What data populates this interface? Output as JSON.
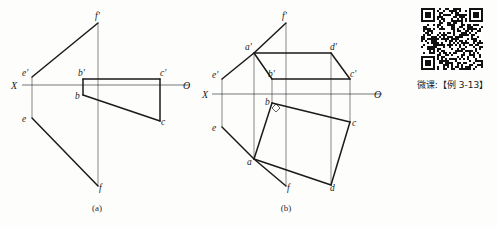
{
  "page": {
    "background_color": "#fdfdfc",
    "width": 497,
    "height": 227
  },
  "figures": [
    {
      "id": "figure-a",
      "caption": "(a)",
      "caption_pos": {
        "x": 97,
        "y": 211
      },
      "axis": {
        "name": "projection-axis",
        "x_label": "X",
        "o_label": "O",
        "x1": 22,
        "y1": 85,
        "x2": 190,
        "y2": 85,
        "color": "#77787a",
        "x_label_pos": {
          "x": 11,
          "y": 89
        },
        "o_label_pos": {
          "x": 183,
          "y": 89
        }
      },
      "points": [
        {
          "name": "f-prime",
          "label": "f'",
          "x": 98,
          "y": 23,
          "lx": 95,
          "ly": 19
        },
        {
          "name": "e-prime",
          "label": "e'",
          "x": 32,
          "y": 77,
          "lx": 22,
          "ly": 76
        },
        {
          "name": "b-prime",
          "label": "b'",
          "x": 83,
          "y": 79,
          "lx": 78,
          "ly": 76
        },
        {
          "name": "c-prime",
          "label": "c'",
          "x": 160,
          "y": 79,
          "lx": 160,
          "ly": 76
        },
        {
          "name": "b",
          "label": "b",
          "x": 83,
          "y": 95,
          "lx": 75,
          "ly": 99
        },
        {
          "name": "c",
          "label": "c",
          "x": 160,
          "y": 121,
          "lx": 161,
          "ly": 125
        },
        {
          "name": "e",
          "label": "e",
          "x": 32,
          "y": 118,
          "lx": 22,
          "ly": 122
        },
        {
          "name": "f",
          "label": "f",
          "x": 98,
          "y": 186,
          "lx": 99,
          "ly": 191
        }
      ],
      "thin_lines": [
        {
          "name": "vline-e",
          "x1": 32,
          "y1": 77,
          "x2": 32,
          "y2": 118
        },
        {
          "name": "vline-f",
          "x1": 98,
          "y1": 23,
          "x2": 98,
          "y2": 186
        }
      ],
      "thick_lines": [
        {
          "name": "seg-ef-prime",
          "x1": 32,
          "y1": 77,
          "x2": 98,
          "y2": 23
        },
        {
          "name": "seg-ef",
          "x1": 32,
          "y1": 118,
          "x2": 98,
          "y2": 186
        },
        {
          "name": "seg-bc-prime",
          "x1": 83,
          "y1": 79,
          "x2": 160,
          "y2": 79
        },
        {
          "name": "seg-bprime-b",
          "x1": 83,
          "y1": 79,
          "x2": 83,
          "y2": 95
        },
        {
          "name": "seg-cprime-c",
          "x1": 160,
          "y1": 79,
          "x2": 160,
          "y2": 121
        },
        {
          "name": "seg-bc",
          "x1": 83,
          "y1": 95,
          "x2": 160,
          "y2": 121
        }
      ]
    },
    {
      "id": "figure-b",
      "caption": "(b)",
      "caption_pos": {
        "x": 286,
        "y": 211
      },
      "axis": {
        "name": "projection-axis",
        "x_label": "X",
        "o_label": "O",
        "x1": 212,
        "y1": 94,
        "x2": 382,
        "y2": 94,
        "color": "#77787a",
        "x_label_pos": {
          "x": 202,
          "y": 98
        },
        "o_label_pos": {
          "x": 374,
          "y": 98
        }
      },
      "points": [
        {
          "name": "f-prime",
          "label": "f'",
          "x": 286,
          "y": 23,
          "lx": 282,
          "ly": 19
        },
        {
          "name": "a-prime",
          "label": "a'",
          "x": 254,
          "y": 53,
          "lx": 245,
          "ly": 50
        },
        {
          "name": "d-prime",
          "label": "d'",
          "x": 331,
          "y": 53,
          "lx": 330,
          "ly": 50
        },
        {
          "name": "e-prime",
          "label": "e'",
          "x": 222,
          "y": 79,
          "lx": 212,
          "ly": 78
        },
        {
          "name": "b-prime",
          "label": "b'",
          "x": 272,
          "y": 79,
          "lx": 268,
          "ly": 77
        },
        {
          "name": "c-prime",
          "label": "c'",
          "x": 350,
          "y": 79,
          "lx": 350,
          "ly": 77
        },
        {
          "name": "b",
          "label": "b",
          "x": 272,
          "y": 103,
          "lx": 265,
          "ly": 105
        },
        {
          "name": "c",
          "label": "c",
          "x": 350,
          "y": 122,
          "lx": 352,
          "ly": 126
        },
        {
          "name": "e",
          "label": "e",
          "x": 222,
          "y": 127,
          "lx": 212,
          "ly": 131
        },
        {
          "name": "a",
          "label": "a",
          "x": 254,
          "y": 159,
          "lx": 247,
          "ly": 165
        },
        {
          "name": "f",
          "label": "f",
          "x": 286,
          "y": 186,
          "lx": 287,
          "ly": 191
        },
        {
          "name": "d",
          "label": "d",
          "x": 331,
          "y": 185,
          "lx": 330,
          "ly": 191
        }
      ],
      "thin_lines": [
        {
          "name": "vline-e",
          "x1": 222,
          "y1": 79,
          "x2": 222,
          "y2": 127
        },
        {
          "name": "vline-a",
          "x1": 254,
          "y1": 53,
          "x2": 254,
          "y2": 159
        },
        {
          "name": "vline-f",
          "x1": 286,
          "y1": 23,
          "x2": 286,
          "y2": 186
        },
        {
          "name": "vline-d",
          "x1": 331,
          "y1": 53,
          "x2": 331,
          "y2": 185
        },
        {
          "name": "vline-c",
          "x1": 350,
          "y1": 79,
          "x2": 350,
          "y2": 122
        },
        {
          "name": "vline-b",
          "x1": 272,
          "y1": 79,
          "x2": 272,
          "y2": 103
        }
      ],
      "thick_lines": [
        {
          "name": "seg-aprime-fprime",
          "x1": 254,
          "y1": 53,
          "x2": 286,
          "y2": 23
        },
        {
          "name": "seg-eprime-aprime",
          "x1": 222,
          "y1": 79,
          "x2": 254,
          "y2": 53
        },
        {
          "name": "seg-aprime-dprime",
          "x1": 254,
          "y1": 53,
          "x2": 331,
          "y2": 53
        },
        {
          "name": "seg-dprime-cprime",
          "x1": 331,
          "y1": 53,
          "x2": 350,
          "y2": 79
        },
        {
          "name": "seg-aprime-bprime",
          "x1": 254,
          "y1": 53,
          "x2": 272,
          "y2": 79
        },
        {
          "name": "seg-bprime-cprime",
          "x1": 272,
          "y1": 79,
          "x2": 350,
          "y2": 79
        },
        {
          "name": "seg-e-a",
          "x1": 222,
          "y1": 127,
          "x2": 254,
          "y2": 159
        },
        {
          "name": "seg-a-f",
          "x1": 254,
          "y1": 159,
          "x2": 286,
          "y2": 186
        },
        {
          "name": "seg-b-a",
          "x1": 272,
          "y1": 103,
          "x2": 254,
          "y2": 159
        },
        {
          "name": "seg-b-c",
          "x1": 272,
          "y1": 103,
          "x2": 350,
          "y2": 122
        },
        {
          "name": "seg-a-d",
          "x1": 254,
          "y1": 159,
          "x2": 331,
          "y2": 185
        },
        {
          "name": "seg-c-d",
          "x1": 350,
          "y1": 122,
          "x2": 331,
          "y2": 185
        }
      ],
      "right_angle_marker": {
        "name": "right-angle-marker-b",
        "points": "276,104 280,108 276,112 272,108"
      }
    }
  ],
  "qr_block": {
    "name": "qr-code",
    "caption": "微课:【例 3-13】",
    "seed": 20240313
  },
  "colors": {
    "line": "#1a1a1a",
    "axis": "#77787a",
    "text": "#1a1a1a"
  }
}
